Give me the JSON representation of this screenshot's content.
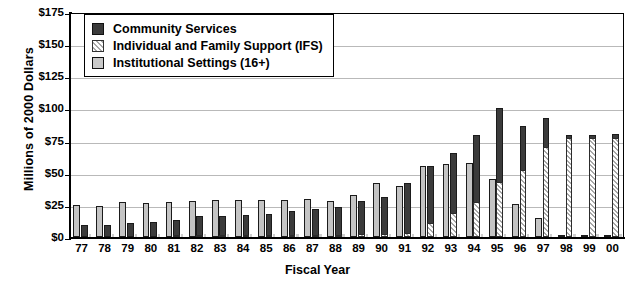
{
  "chart_data": {
    "type": "bar",
    "title": "",
    "xlabel": "Fiscal Year",
    "ylabel": "Millions of 2000 Dollars",
    "ylim": [
      0,
      175
    ],
    "ytick_labels": [
      "$175",
      "$150",
      "$125",
      "$100",
      "$75",
      "$50",
      "$25",
      "$0"
    ],
    "ytick_values": [
      175,
      150,
      125,
      100,
      75,
      50,
      25,
      0
    ],
    "grid": true,
    "grouping": "grouped-with-stacked-community-over-ifs",
    "legend_position": "top-left-inside",
    "categories": [
      "77",
      "78",
      "79",
      "80",
      "81",
      "82",
      "83",
      "84",
      "85",
      "86",
      "87",
      "88",
      "89",
      "90",
      "91",
      "92",
      "93",
      "94",
      "95",
      "96",
      "97",
      "98",
      "99",
      "00"
    ],
    "series": [
      {
        "name": "Community Services",
        "color": "#3b3b3b",
        "values": [
          9,
          9.5,
          11,
          12,
          13,
          15,
          15.5,
          16,
          17,
          18.5,
          20,
          22,
          26,
          29.5,
          38.5,
          44.5,
          46,
          52.5,
          57.5,
          34.5,
          22.5,
          2,
          2,
          3
        ]
      },
      {
        "name": "Individual and Family Support (IFS)",
        "color": "#e3e3e3",
        "hatch": "diagonal",
        "values": [
          0,
          0,
          0,
          0,
          0.5,
          1,
          1,
          1,
          1,
          1.5,
          1.5,
          1.5,
          2,
          2,
          3.5,
          11,
          19,
          27,
          43,
          52,
          70,
          77,
          77,
          77
        ]
      },
      {
        "name": "Institutional Settings (16+)",
        "color": "#c4c4c4",
        "values": [
          25,
          24.5,
          27.5,
          26.5,
          27,
          28,
          29,
          28.5,
          28.5,
          29,
          29.5,
          28,
          33,
          42,
          40,
          55.5,
          56.5,
          57.5,
          45,
          25.5,
          15,
          1,
          1,
          1.5
        ]
      }
    ],
    "stacked_totals_community_plus_ifs": [
      9,
      9.5,
      11,
      12,
      13.5,
      16,
      16.5,
      17,
      18,
      20,
      21.5,
      23.5,
      28,
      31.5,
      42,
      55.5,
      65,
      79.5,
      100.5,
      86.5,
      92.5,
      79,
      79,
      80
    ]
  },
  "legend": {
    "items": [
      {
        "label": "Community Services",
        "swatch": "swatch-community"
      },
      {
        "label": "Individual and Family Support (IFS)",
        "swatch": "swatch-ifs"
      },
      {
        "label": "Institutional Settings (16+)",
        "swatch": "swatch-institutional"
      }
    ]
  }
}
